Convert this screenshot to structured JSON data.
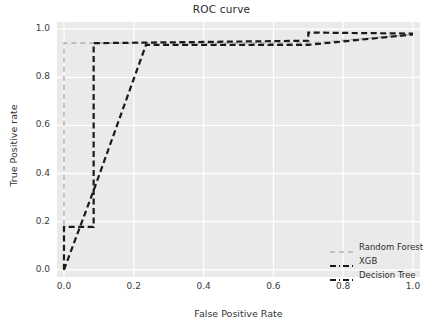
{
  "chart_data": {
    "type": "line",
    "title": "ROC curve",
    "xlabel": "False Positive Rate",
    "ylabel": "True Positive rate",
    "xlim": [
      -0.02,
      1.02
    ],
    "ylim": [
      -0.03,
      1.03
    ],
    "grid": true,
    "legend_position": "lower right",
    "xticks": [
      "0.0",
      "0.2",
      "0.4",
      "0.6",
      "0.8",
      "1.0"
    ],
    "xtick_values": [
      0.0,
      0.2,
      0.4,
      0.6,
      0.8,
      1.0
    ],
    "yticks": [
      "0.0",
      "0.2",
      "0.4",
      "0.6",
      "0.8",
      "1.0"
    ],
    "ytick_values": [
      0.0,
      0.2,
      0.4,
      0.6,
      0.8,
      1.0
    ],
    "series": [
      {
        "name": "Random Forest",
        "color": "#b7b7b7",
        "linestyle": "dashed",
        "x": [
          0.0,
          0.0,
          0.7,
          1.0
        ],
        "y": [
          0.0,
          0.942,
          0.942,
          0.978
        ]
      },
      {
        "name": "XGB",
        "color": "#1a1a1a",
        "linestyle": "dashdot",
        "x": [
          0.0,
          0.0,
          0.085,
          0.085,
          0.7,
          0.7,
          1.0
        ],
        "y": [
          0.0,
          0.178,
          0.178,
          0.942,
          0.952,
          0.986,
          0.982
        ]
      },
      {
        "name": "Decision Tree",
        "color": "#1a1a1a",
        "linestyle": "dashdot",
        "x": [
          0.0,
          0.085,
          0.235,
          0.7,
          1.0
        ],
        "y": [
          0.0,
          0.33,
          0.935,
          0.935,
          0.978
        ]
      }
    ]
  },
  "title": "ROC curve",
  "axes": {
    "x_title": "False Positive Rate",
    "y_title": "True Positive rate"
  },
  "legend": {
    "items": [
      {
        "label": "Random Forest",
        "color": "#b7b7b7"
      },
      {
        "label": "XGB",
        "color": "#1a1a1a"
      },
      {
        "label": "Decision Tree",
        "color": "#1a1a1a"
      }
    ]
  },
  "style": {
    "plot_background": "#eaeaea",
    "grid_color": "#ffffff",
    "figure_background": "#ffffff",
    "text_color": "#333333"
  }
}
